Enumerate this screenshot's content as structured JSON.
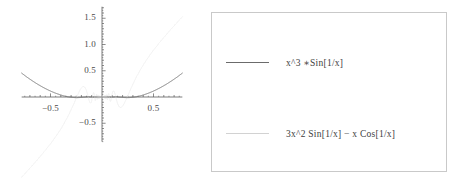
{
  "figure": {
    "title": "",
    "background_color": "#ffffff"
  },
  "plot": {
    "axis_color": "#5a5a5a",
    "y_tick_labels": [
      "1.5",
      "1.0",
      "0.5",
      "-0.5"
    ],
    "x_tick_labels": [
      "-0.5",
      "0.5"
    ],
    "label_color": "#4a4a4a"
  },
  "legend": {
    "border_color": "#c9c9c9",
    "entries": [
      {
        "label": "x^3 ∗Sin[1/x]",
        "color": "#6b6b6b",
        "swatch_name": "legend-line-swatch-1"
      },
      {
        "label": "3x^2 Sin[1/x]  − x Cos[1/x]",
        "color": "#d2d2d2",
        "swatch_name": "legend-line-swatch-2"
      }
    ]
  },
  "chart_data": {
    "type": "line",
    "title": "",
    "xlabel": "",
    "ylabel": "",
    "xlim": [
      -0.78,
      0.78
    ],
    "ylim": [
      -0.85,
      1.72
    ],
    "xticks": [
      -0.5,
      0.5
    ],
    "xticklabels": [
      "-0.5",
      "0.5"
    ],
    "yticks": [
      -0.5,
      0.5,
      1.0,
      1.5
    ],
    "yticklabels": [
      "-0.5",
      "0.5",
      "1.0",
      "1.5"
    ],
    "grid": false,
    "legend_position": "right-outside",
    "axes_style": "mathematica-cross-axes",
    "series": [
      {
        "name": "x^3 ∗Sin[1/x]",
        "color": "#6b6b6b",
        "width": 1,
        "x": [
          -0.78,
          -0.72,
          -0.66,
          -0.6,
          -0.54,
          -0.48,
          -0.42,
          -0.36,
          -0.3,
          -0.24,
          -0.18,
          -0.12,
          -0.06,
          0.0,
          0.06,
          0.12,
          0.18,
          0.24,
          0.3,
          0.36,
          0.42,
          0.48,
          0.54,
          0.6,
          0.66,
          0.72,
          0.78
        ],
        "y": [
          0.56,
          0.45,
          0.34,
          0.25,
          0.17,
          0.11,
          0.06,
          0.03,
          0.01,
          0.004,
          0.001,
          0.0004,
          7e-05,
          0.0,
          7e-05,
          0.0004,
          0.001,
          0.004,
          0.01,
          0.03,
          0.06,
          0.11,
          0.17,
          0.25,
          0.34,
          0.45,
          0.56
        ]
      },
      {
        "name": "3x^2 Sin[1/x] − x Cos[1/x]",
        "color": "#ededed",
        "width": 1,
        "x": [
          -0.78,
          -0.7,
          -0.62,
          -0.54,
          -0.46,
          -0.38,
          -0.3,
          -0.22,
          -0.14,
          -0.06,
          0.0,
          0.06,
          0.14,
          0.22,
          0.3,
          0.38,
          0.46,
          0.54,
          0.62,
          0.7,
          0.78
        ],
        "y": [
          -0.82,
          -0.7,
          -0.58,
          -0.46,
          -0.34,
          -0.24,
          -0.15,
          -0.08,
          -0.03,
          -0.004,
          0.0,
          0.004,
          0.03,
          0.08,
          0.15,
          0.24,
          0.34,
          0.46,
          0.58,
          0.7,
          0.82
        ]
      }
    ]
  }
}
